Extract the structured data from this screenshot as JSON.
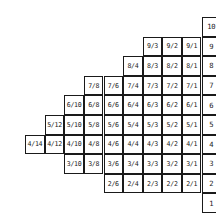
{
  "grid": {
    "origin_x": 6,
    "origin_y": 17.5,
    "cell_size": 19.6,
    "columns": 11,
    "rows": [
      {
        "row_label": "10",
        "cells": []
      },
      {
        "row_label": "9",
        "cells": [
          "9/3",
          "9/2",
          "9/1"
        ]
      },
      {
        "row_label": "8",
        "cells": [
          "8/4",
          "8/3",
          "8/2",
          "8/1"
        ]
      },
      {
        "row_label": "7",
        "cells": [
          "7/8",
          "7/6",
          "7/4",
          "7/3",
          "7/2",
          "7/1"
        ]
      },
      {
        "row_label": "6",
        "cells": [
          "6/10",
          "6/8",
          "6/6",
          "6/4",
          "6/3",
          "6/2",
          "6/1"
        ]
      },
      {
        "row_label": "5",
        "cells": [
          "5/12",
          "5/10",
          "5/8",
          "5/6",
          "5/4",
          "5/3",
          "5/2",
          "5/1"
        ]
      },
      {
        "row_label": "4",
        "cells": [
          "4/14",
          "4/12",
          "4/10",
          "4/8",
          "4/6",
          "4/4",
          "4/3",
          "4/2",
          "4/1"
        ]
      },
      {
        "row_label": "3",
        "cells": [
          "3/10",
          "3/8",
          "3/6",
          "3/4",
          "3/3",
          "3/2",
          "3/1"
        ]
      },
      {
        "row_label": "2",
        "cells": [
          "2/6",
          "2/4",
          "2/3",
          "2/2",
          "2/1"
        ]
      },
      {
        "row_label": "1",
        "cells": []
      }
    ]
  }
}
